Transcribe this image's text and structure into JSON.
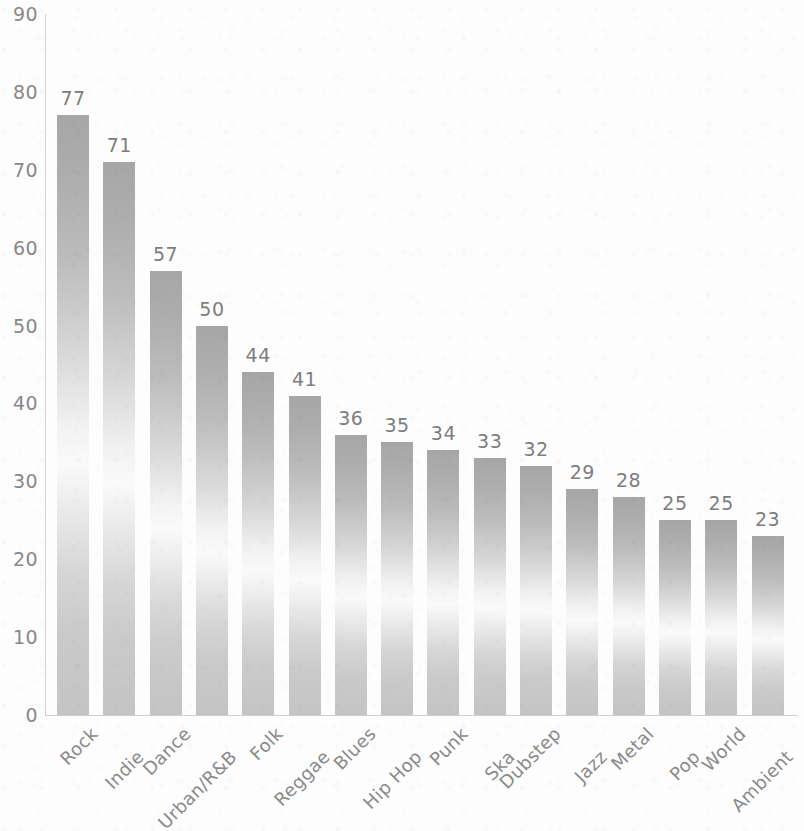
{
  "chart_data": {
    "type": "bar",
    "title": "",
    "subtitle": "",
    "xlabel": "",
    "ylabel": "",
    "ylim": [
      0,
      90
    ],
    "y_ticks": [
      0,
      10,
      20,
      30,
      40,
      50,
      60,
      70,
      80,
      90
    ],
    "grid": false,
    "legend": null,
    "orientation": "vertical",
    "bar_value_labels": true,
    "x_tick_rotation": -45,
    "categories": [
      "Rock",
      "Indie",
      "Dance",
      "Urban/R&B",
      "Folk",
      "Reggae",
      "Blues",
      "Hip Hop",
      "Punk",
      "Ska",
      "Dubstep",
      "Jazz",
      "Metal",
      "Pop",
      "World",
      "Ambient"
    ],
    "values": [
      77,
      71,
      57,
      50,
      44,
      41,
      36,
      35,
      34,
      33,
      32,
      29,
      28,
      25,
      25,
      23
    ],
    "value_labels": [
      "77",
      "71",
      "57",
      "50",
      "44",
      "41",
      "36",
      "35",
      "34",
      "33",
      "32",
      "29",
      "28",
      "25",
      "25",
      "23"
    ],
    "colors": {
      "bar_top": "#a6a6a6",
      "bar_mid": "#fafafa",
      "bar_bottom": "#c4c4c4",
      "axis_line": "#d2d2d2",
      "tick_text": "#888888",
      "value_text": "#7d7d7d",
      "category_text": "#8a8a8a",
      "background": "#fdfdfd"
    }
  }
}
